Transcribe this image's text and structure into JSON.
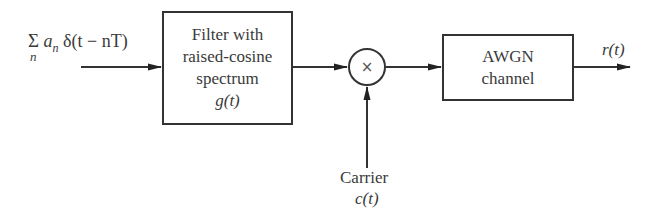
{
  "diagram": {
    "type": "block-diagram",
    "input": {
      "sum_symbol": "Σ",
      "sum_index": "n",
      "expression": "a",
      "expression_sub": "n",
      "delta_term": " δ(t − nT)"
    },
    "blocks": [
      {
        "id": "filter",
        "lines": [
          "Filter with",
          "raised-cosine",
          "spectrum",
          "g(t)"
        ]
      },
      {
        "id": "mixer",
        "symbol": "×"
      },
      {
        "id": "channel",
        "lines": [
          "AWGN",
          "channel"
        ]
      }
    ],
    "carrier": {
      "label": "Carrier",
      "signal": "c(t)"
    },
    "output": {
      "signal": "r(t)"
    },
    "edges": [
      {
        "from": "input",
        "to": "filter"
      },
      {
        "from": "filter",
        "to": "mixer"
      },
      {
        "from": "carrier",
        "to": "mixer"
      },
      {
        "from": "mixer",
        "to": "channel"
      },
      {
        "from": "channel",
        "to": "output"
      }
    ]
  }
}
